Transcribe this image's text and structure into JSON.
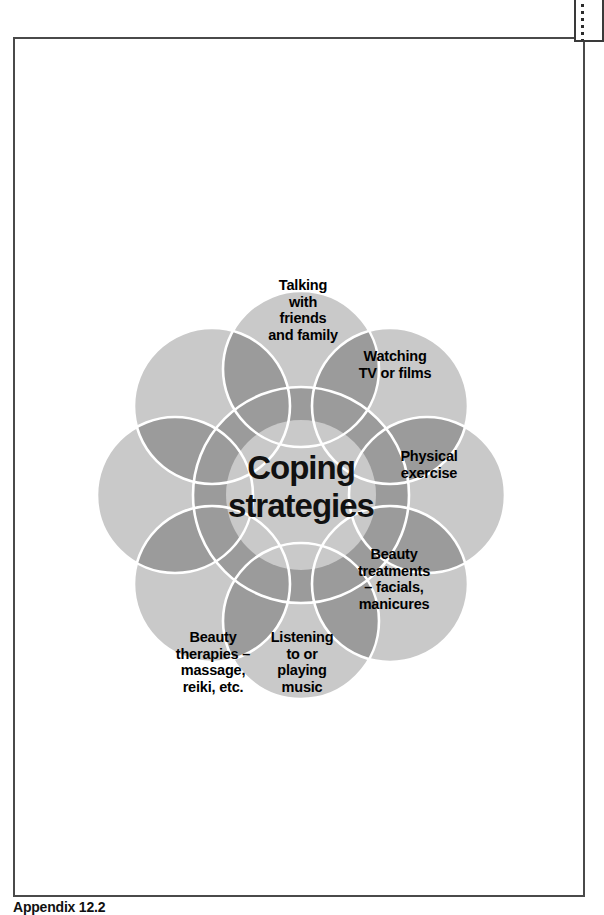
{
  "document": {
    "caption": "Appendix 12.2"
  },
  "edge_tab": {
    "name": "page-edge-tab",
    "dot_count": 6
  },
  "diagram": {
    "title": "Coping\nstrategies",
    "center_label": "Coping\nstrategies",
    "type": "overlapping-circles-flower",
    "petal_count": 8,
    "colors": {
      "petal_fill": "#c9c9c9",
      "overlap_fill": "#9b9b9b",
      "center_fill": "#c9c9c9",
      "outline": "#ffffff",
      "text": "#000000",
      "page_border": "#4a4a4a"
    },
    "petals": [
      {
        "id": "top",
        "label": "Talking\nwith\nfriends\nand family",
        "angle_deg": 270,
        "has_text": true
      },
      {
        "id": "top-right",
        "label": "Watching\nTV or films",
        "angle_deg": 315,
        "has_text": true
      },
      {
        "id": "right",
        "label": "Physical\nexercise",
        "angle_deg": 0,
        "has_text": true
      },
      {
        "id": "bottom-right",
        "label": "Beauty\ntreatments\n– facials,\nmanicures",
        "angle_deg": 45,
        "has_text": true
      },
      {
        "id": "bottom",
        "label": "Listening\nto or\nplaying\nmusic",
        "angle_deg": 90,
        "has_text": true
      },
      {
        "id": "bottom-left",
        "label": "Beauty\ntherapies –\nmassage,\nreiki, etc.",
        "angle_deg": 135,
        "has_text": true
      },
      {
        "id": "left",
        "label": "",
        "angle_deg": 180,
        "has_text": false
      },
      {
        "id": "top-left",
        "label": "",
        "angle_deg": 225,
        "has_text": false
      }
    ]
  }
}
